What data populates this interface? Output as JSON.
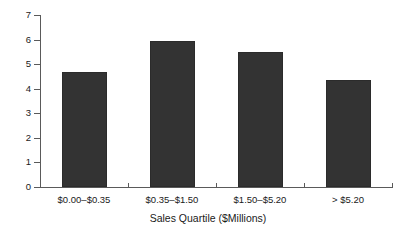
{
  "chart_data": {
    "type": "bar",
    "title": "",
    "subtitle": "",
    "xlabel": "Sales Quartile ($Millions)",
    "ylabel": "",
    "categories": [
      "$0.00–$0.35",
      "$0.35–$1.50",
      "$1.50–$5.20",
      "> $5.20"
    ],
    "values": [
      4.7,
      5.95,
      5.5,
      4.35
    ],
    "ylim": [
      0,
      7
    ],
    "yticks": [
      0,
      1,
      2,
      3,
      4,
      5,
      6,
      7
    ],
    "ytick_labels": [
      "0",
      "1",
      "2",
      "3",
      "4",
      "5",
      "6",
      "7"
    ],
    "grid": false,
    "legend": null,
    "bar_color": "#333333",
    "axis_color": "#5a5a5a",
    "background_color": "#ffffff"
  },
  "axis": {
    "y_labels": [
      "7",
      "6",
      "5",
      "4",
      "3",
      "2",
      "1",
      "0"
    ],
    "x_title": "Sales Quartile ($Millions)"
  },
  "bars": [
    {
      "label": "$0.00–$0.35",
      "value": 4.7
    },
    {
      "label": "$0.35–$1.50",
      "value": 5.95
    },
    {
      "label": "$1.50–$5.20",
      "value": 5.5
    },
    {
      "label": "> $5.20",
      "value": 4.35
    }
  ]
}
